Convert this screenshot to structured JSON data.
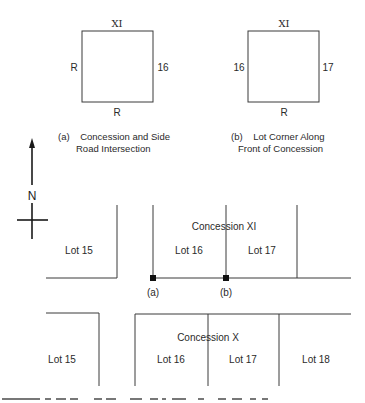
{
  "figure": {
    "detail_a": {
      "top_label": "XI",
      "left_label": "R",
      "right_label": "16",
      "bottom_label": "R",
      "caption_line1": "(a)    Concession and Side",
      "caption_line2": "Road Intersection"
    },
    "detail_b": {
      "top_label": "XI",
      "left_label": "16",
      "right_label": "17",
      "bottom_label": "R",
      "caption_line1": "(b)    Lot Corner Along",
      "caption_line2": "Front of Concession"
    },
    "north_arrow": {
      "label": "N"
    },
    "upper_map": {
      "concession_label": "Concession XI",
      "lots": [
        "Lot 15",
        "Lot 16",
        "Lot 17"
      ],
      "markers": [
        "(a)",
        "(b)"
      ]
    },
    "lower_map": {
      "concession_label": "Concession X",
      "lots": [
        "Lot 15",
        "Lot 16",
        "Lot 17",
        "Lot 18"
      ]
    },
    "colors": {
      "line": "#3a3a3a",
      "text": "#2a2a2a",
      "background": "#ffffff"
    }
  }
}
